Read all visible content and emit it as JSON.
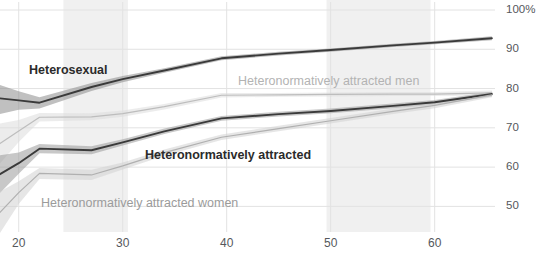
{
  "chart_data": {
    "type": "line",
    "title": "",
    "xlabel": "",
    "ylabel": "",
    "xlim": [
      18.2,
      65.8
    ],
    "ylim": [
      44.5,
      100
    ],
    "grid": true,
    "legend_position": "inline-annotations",
    "x_ticks": [
      20,
      30,
      40,
      50,
      60
    ],
    "x_tick_labels": [
      "20",
      "30",
      "40",
      "50",
      "60"
    ],
    "y_ticks": [
      50,
      60,
      70,
      80,
      90,
      100
    ],
    "y_tick_labels": [
      "50",
      "60",
      "70",
      "80",
      "90",
      "100%"
    ],
    "shaded_x_bands": [
      [
        24.3,
        30.5
      ],
      [
        49.6,
        59.6
      ]
    ],
    "series": [
      {
        "name": "Heterosexual",
        "color": "#3a3a3a",
        "band_color": "#8c8c8c",
        "label_style": "bold-dark",
        "x": [
          18.2,
          20.0,
          22.0,
          27.0,
          30.0,
          34.0,
          39.5,
          45.0,
          50.0,
          56.0,
          60.0,
          65.5
        ],
        "values": [
          77.5,
          77.0,
          76.4,
          80.4,
          82.4,
          84.6,
          87.7,
          88.9,
          89.8,
          91.0,
          91.7,
          92.8
        ],
        "lower": [
          73.5,
          74.6,
          74.9,
          79.4,
          81.6,
          84.0,
          87.2,
          88.4,
          89.4,
          90.6,
          91.3,
          92.3
        ],
        "upper": [
          80.9,
          79.3,
          77.8,
          81.4,
          83.2,
          85.2,
          88.2,
          89.4,
          90.2,
          91.4,
          92.1,
          93.3
        ]
      },
      {
        "name": "Heteronormatively attracted men",
        "color": "#bdbdbd",
        "band_color": "#dcdcdc",
        "label_style": "light",
        "x": [
          18.2,
          20.0,
          22.0,
          27.0,
          30.0,
          34.0,
          39.5,
          45.0,
          50.0,
          56.0,
          60.0,
          65.5
        ],
        "values": [
          66.0,
          69.2,
          72.7,
          72.8,
          73.6,
          75.4,
          78.3,
          78.4,
          78.5,
          78.6,
          78.6,
          78.9
        ],
        "lower": [
          60.9,
          66.4,
          71.6,
          71.9,
          72.8,
          74.7,
          77.7,
          77.9,
          78.0,
          78.1,
          78.1,
          78.3
        ],
        "upper": [
          71.1,
          72.0,
          73.8,
          73.7,
          74.4,
          76.1,
          78.9,
          78.9,
          79.0,
          79.1,
          79.1,
          79.5
        ]
      },
      {
        "name": "Heteronormatively attracted",
        "color": "#3a3a3a",
        "band_color": "#9a9a9a",
        "label_style": "bold-dark",
        "x": [
          18.2,
          20.0,
          22.0,
          27.0,
          30.0,
          34.0,
          39.5,
          45.0,
          50.0,
          56.0,
          60.0,
          65.5
        ],
        "values": [
          58.2,
          61.0,
          64.7,
          64.3,
          66.3,
          69.1,
          72.4,
          73.5,
          74.3,
          75.6,
          76.5,
          78.6
        ],
        "lower": [
          53.4,
          58.3,
          63.5,
          63.3,
          65.5,
          68.4,
          71.8,
          72.9,
          73.7,
          75.0,
          75.9,
          78.0
        ],
        "upper": [
          63.0,
          63.7,
          65.9,
          65.3,
          67.1,
          69.8,
          73.0,
          74.1,
          74.9,
          76.2,
          77.1,
          79.2
        ]
      },
      {
        "name": "Heteronormatively attracted women",
        "color": "#b0b0b0",
        "band_color": "#d2d2d2",
        "label_style": "light",
        "x": [
          18.2,
          20.0,
          22.0,
          27.0,
          30.0,
          34.0,
          39.5,
          45.0,
          50.0,
          56.0,
          60.0,
          65.5
        ],
        "values": [
          48.5,
          53.5,
          58.4,
          58.0,
          60.3,
          63.7,
          67.6,
          69.8,
          71.8,
          74.2,
          75.7,
          78.4
        ],
        "lower": [
          43.2,
          50.6,
          57.0,
          56.7,
          59.4,
          62.9,
          66.9,
          69.1,
          71.1,
          73.5,
          75.0,
          77.8
        ],
        "upper": [
          53.8,
          56.4,
          59.8,
          59.3,
          61.2,
          64.5,
          68.3,
          70.5,
          72.5,
          74.9,
          76.4,
          79.0
        ]
      }
    ],
    "annotations": [
      {
        "text": "Heterosexual",
        "x_px": 29,
        "y_px": 74,
        "style": "bold-dark",
        "anchor": "start"
      },
      {
        "text": "Heteronormatively attracted men",
        "x_px": 238,
        "y_px": 85,
        "style": "light",
        "anchor": "start"
      },
      {
        "text": "Heteronormatively attracted",
        "x_px": 145,
        "y_px": 159,
        "style": "bold-dark",
        "anchor": "start"
      },
      {
        "text": "Heteronormatively attracted women",
        "x_px": 41,
        "y_px": 207,
        "style": "mid",
        "anchor": "start"
      }
    ]
  }
}
